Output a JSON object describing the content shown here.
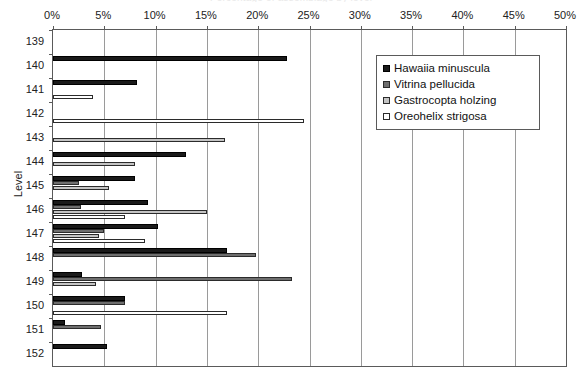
{
  "chart_data": {
    "type": "bar",
    "orientation": "horizontal",
    "title": "",
    "xlabel": "",
    "ylabel": "Level",
    "xlim": [
      0,
      50
    ],
    "xticks": [
      0,
      5,
      10,
      15,
      20,
      25,
      30,
      35,
      40,
      45,
      50
    ],
    "xticklabels": [
      "0%",
      "5%",
      "10%",
      "15%",
      "20%",
      "25%",
      "30%",
      "35%",
      "40%",
      "45%",
      "50%"
    ],
    "grid": true,
    "grid_axis": "x",
    "legend_position": "upper right",
    "categories": [
      "139",
      "140",
      "141",
      "142",
      "143",
      "144",
      "145",
      "146",
      "147",
      "148",
      "149",
      "150",
      "151",
      "152"
    ],
    "series": [
      {
        "name": "Hawaiia minuscula",
        "color": "#1a1a1a",
        "values": [
          0,
          22.8,
          8.2,
          0,
          0,
          13.0,
          8.0,
          9.3,
          10.2,
          17.0,
          2.8,
          7.0,
          1.2,
          5.3
        ]
      },
      {
        "name": "Vitrina pellucida",
        "color": "#6e6e6e",
        "values": [
          0,
          0,
          0,
          0,
          0,
          0,
          2.5,
          2.7,
          5.0,
          19.8,
          23.3,
          7.0,
          4.7,
          0
        ]
      },
      {
        "name": "Gastrocopta holzing",
        "color": "#c4c4c4",
        "values": [
          0,
          0,
          0,
          0,
          16.8,
          8.0,
          5.5,
          15.0,
          4.5,
          0,
          4.2,
          0,
          0,
          0
        ]
      },
      {
        "name": "Oreohelix strigosa",
        "color": "#ffffff",
        "values": [
          0,
          0,
          3.9,
          24.5,
          0,
          0,
          0,
          7.0,
          9.0,
          0,
          0,
          17.0,
          0,
          0
        ]
      }
    ]
  },
  "axes": {
    "y_axis_title": "Level",
    "x_tick_labels": [
      "0%",
      "5%",
      "10%",
      "15%",
      "20%",
      "25%",
      "30%",
      "35%",
      "40%",
      "45%",
      "50%"
    ],
    "y_tick_labels": [
      "139",
      "140",
      "141",
      "142",
      "143",
      "144",
      "145",
      "146",
      "147",
      "148",
      "149",
      "150",
      "151",
      "152"
    ]
  },
  "legend": {
    "entries": [
      {
        "label": "Hawaiia minuscula",
        "swatch": "s0"
      },
      {
        "label": "Vitrina pellucida",
        "swatch": "s1"
      },
      {
        "label": "Gastrocopta holzing",
        "swatch": "s2"
      },
      {
        "label": "Oreohelix strigosa",
        "swatch": "s3"
      }
    ]
  },
  "title": {
    "text": "Percentage of assemblage by level"
  }
}
